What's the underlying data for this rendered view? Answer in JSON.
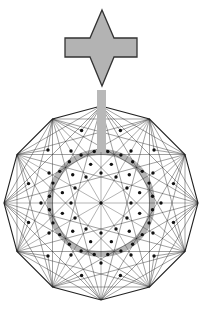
{
  "figure": {
    "title": "",
    "background": "#ffffff",
    "arrow_shape": {
      "name": "four-point-star-arrow",
      "fill": "#b3b3b3",
      "stroke": "#333333",
      "top_point": [
        102,
        10
      ],
      "bar": {
        "x1": 65,
        "x2": 137,
        "y1": 38,
        "y2": 57
      },
      "bottom_point": [
        102,
        86
      ],
      "waist_x": [
        90,
        114
      ]
    },
    "stem": {
      "fill": "#b8b8b8",
      "x": 97,
      "y": 90,
      "width": 9,
      "height": 62
    },
    "graph": {
      "center": [
        101,
        203
      ],
      "outer_radius": 97,
      "outer_polygon_sides": 12,
      "edge_color": "#222222",
      "node_color": "#111111",
      "highlight_ring": {
        "radius": 51,
        "stroke": "#b5b5b5",
        "width": 6
      },
      "rings": [
        {
          "radius": 97,
          "count": 12,
          "offset_deg": 0,
          "dots": false
        },
        {
          "radius": 75,
          "count": 12,
          "offset_deg": 15,
          "dots": true
        },
        {
          "radius": 60,
          "count": 12,
          "offset_deg": 0,
          "dots": true
        },
        {
          "radius": 52,
          "count": 24,
          "offset_deg": 7.5,
          "dots": true
        },
        {
          "radius": 40,
          "count": 12,
          "offset_deg": 15,
          "dots": true
        },
        {
          "radius": 30,
          "count": 12,
          "offset_deg": 0,
          "dots": true
        }
      ]
    }
  }
}
